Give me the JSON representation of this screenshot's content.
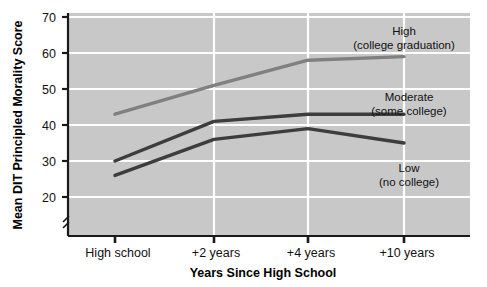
{
  "chart_data": {
    "type": "line",
    "title": "",
    "xlabel": "Years Since High School",
    "ylabel": "Mean DIT Principled Morality Score",
    "categories": [
      "High school",
      "+2 years",
      "+4 years",
      "+10 years"
    ],
    "xtick_labels": [
      "High school",
      "+2 years",
      "+4 years",
      "+10 years"
    ],
    "ytick_labels": [
      "20",
      "30",
      "40",
      "50",
      "60",
      "70"
    ],
    "ytick_values": [
      20,
      30,
      40,
      50,
      60,
      70
    ],
    "ylim": [
      15,
      70
    ],
    "grid": true,
    "grid_color": "#ffffff",
    "plot_background": "#c8c8c8",
    "legend_position": "inline-annotations",
    "series": [
      {
        "name": "High",
        "sublabel": "(college graduation)",
        "annotation_line1": "High",
        "annotation_line2": "(college graduation)",
        "color": "#808080",
        "values": [
          43,
          51,
          58,
          59
        ]
      },
      {
        "name": "Moderate",
        "sublabel": "(some college)",
        "annotation_line1": "Moderate",
        "annotation_line2": "(some college)",
        "color": "#3d3d3d",
        "values": [
          30,
          41,
          43,
          43
        ]
      },
      {
        "name": "Low",
        "sublabel": "(no college)",
        "annotation_line1": "Low",
        "annotation_line2": "(no college)",
        "color": "#3d3d3d",
        "values": [
          26,
          36,
          39,
          35
        ]
      }
    ]
  }
}
